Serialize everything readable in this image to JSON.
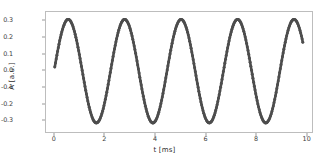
{
  "chart_data": {
    "type": "line",
    "title": "",
    "subtitle": "",
    "xlabel": "t [ms]",
    "ylabel": "A [a.u.]",
    "xlim": [
      -0.35,
      10.25
    ],
    "ylim": [
      -0.375,
      0.355
    ],
    "xticks": [
      0,
      2,
      4,
      6,
      8,
      10
    ],
    "xtick_labels": [
      "0",
      "2",
      "4",
      "6",
      "8",
      "10"
    ],
    "yticks": [
      -0.3,
      -0.2,
      -0.1,
      0.0,
      0.1,
      0.2,
      0.3
    ],
    "ytick_labels": [
      "-0.3",
      "-0.2",
      "-0.1",
      "0.0",
      "0.1",
      "0.2",
      "0.3"
    ],
    "grid": false,
    "legend": null,
    "marker": "circle",
    "marker_color": "#4d4d4d",
    "line_color": "#4d4d4d",
    "series": [
      {
        "name": "A(t)",
        "description": "Sinusoidal oscillation, period 2.25 ms, amplitude 0.31, vertical offset -0.01",
        "x": [
          0.0,
          0.1,
          0.2,
          0.3,
          0.4,
          0.5,
          0.6,
          0.7,
          0.8,
          0.9,
          1.0,
          1.1,
          1.2,
          1.3,
          1.4,
          1.5,
          1.6,
          1.7,
          1.8,
          1.9,
          2.0,
          2.1,
          2.2,
          2.3,
          2.4,
          2.5,
          2.6,
          2.7,
          2.8,
          2.9,
          3.0,
          3.1,
          3.2,
          3.3,
          3.4,
          3.5,
          3.6,
          3.7,
          3.8,
          3.9,
          4.0,
          4.1,
          4.2,
          4.3,
          4.4,
          4.5,
          4.6,
          4.7,
          4.8,
          4.9,
          5.0,
          5.1,
          5.2,
          5.3,
          5.4,
          5.5,
          5.6,
          5.7,
          5.8,
          5.9,
          6.0,
          6.1,
          6.2,
          6.3,
          6.4,
          6.5,
          6.6,
          6.7,
          6.8,
          6.9,
          7.0,
          7.1,
          7.2,
          7.3,
          7.4,
          7.5,
          7.6,
          7.7,
          7.8,
          7.9,
          8.0,
          8.1,
          8.2,
          8.3,
          8.4,
          8.5,
          8.6,
          8.7,
          8.8,
          8.9,
          9.0,
          9.1,
          9.2,
          9.3,
          9.4,
          9.5,
          9.6,
          9.7,
          9.8,
          9.9
        ],
        "y": [
          0.02,
          0.1,
          0.17,
          0.23,
          0.28,
          0.3,
          0.31,
          0.29,
          0.26,
          0.21,
          0.14,
          0.07,
          -0.01,
          -0.09,
          -0.17,
          -0.23,
          -0.28,
          -0.31,
          -0.32,
          -0.31,
          -0.27,
          -0.22,
          -0.15,
          -0.08,
          0.0,
          0.08,
          0.16,
          0.23,
          0.28,
          0.31,
          0.31,
          0.3,
          0.26,
          0.2,
          0.13,
          0.05,
          -0.03,
          -0.11,
          -0.19,
          -0.25,
          -0.3,
          -0.32,
          -0.32,
          -0.3,
          -0.26,
          -0.2,
          -0.13,
          -0.05,
          0.03,
          0.11,
          0.19,
          0.25,
          0.29,
          0.31,
          0.31,
          0.29,
          0.25,
          0.19,
          0.12,
          0.04,
          -0.04,
          -0.12,
          -0.2,
          -0.26,
          -0.3,
          -0.32,
          -0.32,
          -0.29,
          -0.25,
          -0.19,
          -0.11,
          -0.03,
          0.05,
          0.13,
          0.2,
          0.26,
          0.3,
          0.31,
          0.31,
          0.28,
          0.24,
          0.18,
          0.1,
          0.02,
          -0.06,
          -0.14,
          -0.21,
          -0.27,
          -0.31,
          -0.32,
          -0.31,
          -0.29,
          -0.24,
          -0.18,
          -0.1,
          -0.02,
          0.06,
          0.15,
          0.22,
          0.21
        ]
      }
    ],
    "peaks": {
      "t": [
        0.6,
        2.9,
        5.2,
        7.5,
        9.7
      ],
      "A": [
        0.31,
        0.31,
        0.31,
        0.31,
        0.31
      ]
    },
    "troughs": {
      "t": [
        1.8,
        4.1,
        6.4,
        8.8
      ],
      "A": [
        -0.32,
        -0.32,
        -0.32,
        -0.32
      ]
    }
  }
}
